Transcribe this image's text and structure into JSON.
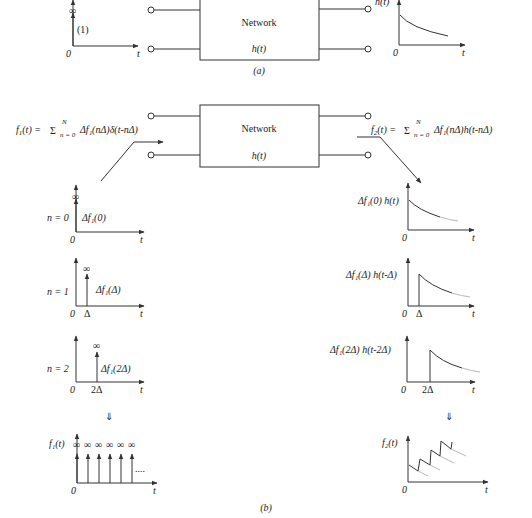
{
  "part_a": {
    "caption": "(a)",
    "input_plot": {
      "impulse_inf": "∞",
      "impulse_weight": "(1)",
      "origin": "0",
      "t_axis": "t"
    },
    "network": {
      "title": "Network",
      "transfer": "h(t)"
    },
    "output_plot": {
      "y_label": "h(t)",
      "origin": "0",
      "t_axis": "t"
    }
  },
  "part_b": {
    "caption": "(b)",
    "input_formula": "f₁(t) = Σ Δf₁(nΔ)δ(t-nΔ)",
    "input_formula_parts": {
      "lhs": "f",
      "sub1": "1",
      "rest": "(t) =",
      "sigma": "Σ",
      "upper": "N",
      "lower": "n = 0",
      "term": "Δf₁(nΔ)δ(t-nΔ)"
    },
    "output_formula_parts": {
      "lhs": "f",
      "sub2": "2",
      "rest": "(t) =",
      "sigma": "Σ",
      "upper": "N",
      "lower": "n = 0",
      "term": "Δf₁(nΔ)h(t-nΔ)"
    },
    "network": {
      "title": "Network",
      "transfer": "h(t)"
    },
    "left_plots": [
      {
        "n_label": "n = 0",
        "weight": "Δf₁(0)",
        "inf": "∞",
        "origin": "0",
        "t_axis": "t",
        "tick": ""
      },
      {
        "n_label": "n = 1",
        "weight": "Δf₁(Δ)",
        "inf": "∞",
        "origin": "0",
        "t_axis": "t",
        "tick": "Δ"
      },
      {
        "n_label": "n = 2",
        "weight": "Δf₁(2Δ)",
        "inf": "∞",
        "origin": "0",
        "t_axis": "t",
        "tick": "2Δ"
      }
    ],
    "right_plots": [
      {
        "label": "Δf₁(0) h(t)",
        "origin": "0",
        "t_axis": "t",
        "tick": ""
      },
      {
        "label": "Δf₁(Δ) h(t-Δ)",
        "origin": "0",
        "t_axis": "t",
        "tick": "Δ"
      },
      {
        "label": "Δf₁(2Δ) h(t-2Δ)",
        "origin": "0",
        "t_axis": "t",
        "tick": "2Δ"
      }
    ],
    "sum_arrow": "⇓",
    "sum_left": {
      "y_label": "f₁(t)",
      "inf": "∞",
      "ellipsis": "....",
      "origin": "0",
      "t_axis": "t"
    },
    "sum_right": {
      "y_label": "f₂(t)",
      "origin": "0",
      "t_axis": "t"
    }
  }
}
